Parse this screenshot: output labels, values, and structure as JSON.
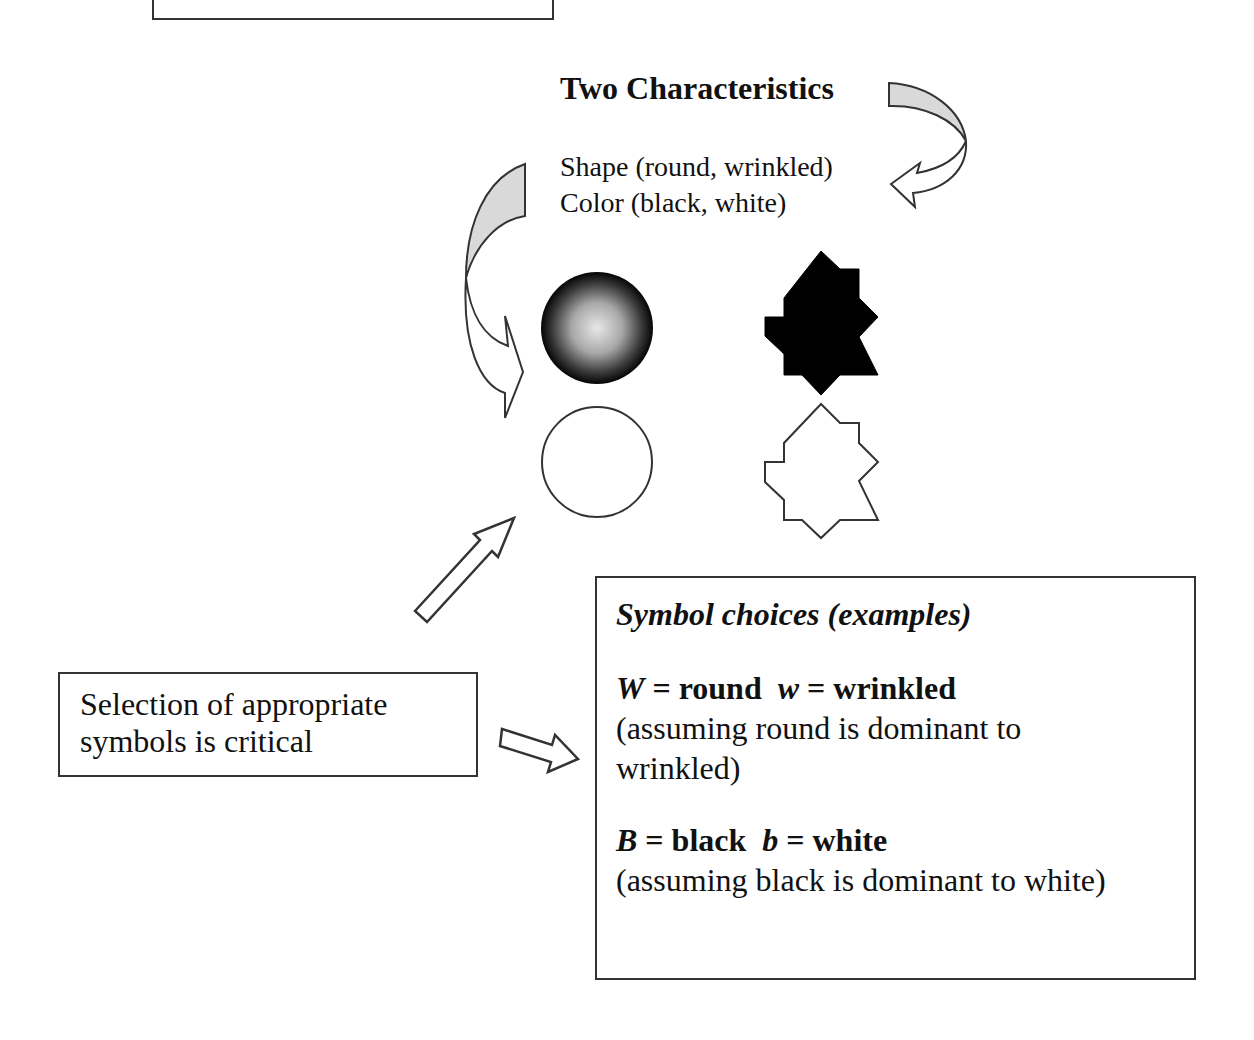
{
  "diagram": {
    "title": "Two Characteristics",
    "characteristics": [
      {
        "label": "Shape (round, wrinkled)"
      },
      {
        "label": "Color (black, white)"
      }
    ],
    "shapes": [
      {
        "id": "round-black",
        "shape": "circle",
        "fill": "black-gradient"
      },
      {
        "id": "wrinkled-black",
        "shape": "wrinkled",
        "fill": "#000000"
      },
      {
        "id": "round-white",
        "shape": "circle",
        "fill": "white"
      },
      {
        "id": "wrinkled-white",
        "shape": "wrinkled",
        "fill": "white"
      }
    ],
    "selection_note": {
      "line1": "Selection of appropriate",
      "line2": "symbols is critical"
    },
    "symbol_box": {
      "heading": "Symbol choices (examples)",
      "shape_rule": {
        "dominant_symbol": "W",
        "dominant_text": " = round  ",
        "recessive_symbol": "w",
        "recessive_text": " = wrinkled",
        "note_line1": "(assuming round is dominant to",
        "note_line2": "wrinkled)"
      },
      "color_rule": {
        "dominant_symbol": "B",
        "dominant_text": " = black  ",
        "recessive_symbol": "b",
        "recessive_text": " = white",
        "note_line1": "(assuming black is dominant to white)"
      }
    },
    "colors": {
      "stroke": "#333333",
      "arrow_shade": "#d9d9d9",
      "text": "#111111"
    }
  }
}
